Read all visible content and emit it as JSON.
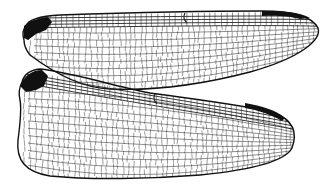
{
  "image": {
    "subject": "Dragonfly wings (forewing and hindwing) line illustration",
    "background": "#ffffff",
    "ink": "#111111",
    "wings": [
      {
        "name": "forewing",
        "outline": "M24,40 C22,33 24,28 26,26 C28,20 40,16 60,15 C120,13 200,11 262,11 C290,11 312,16 318,28 C322,40 300,58 250,72 C200,85 150,91 110,89 C80,88 50,70 30,55 C26,50 24,45 24,40 Z",
        "stigma": "M262,11 C285,11 300,12 310,18 L300,19 C290,16 275,15 262,16 Z",
        "base_dark": "M24,26 C30,20 40,18 48,17 L52,22 L46,30 L36,34 L28,40 L24,38 Z",
        "nodus_x": 185
      },
      {
        "name": "hindwing",
        "outline": "M22,82 C24,74 30,70 40,69 C70,72 110,85 150,93 C200,100 250,106 275,113 C292,120 298,132 292,148 C285,162 250,170 200,175 C150,179 90,180 50,176 C25,172 16,160 18,140 C20,125 22,110 20,100 C18,92 20,86 22,82 Z",
        "stigma": "M245,103 C262,106 276,110 285,118 L282,121 C272,115 258,110 245,108 Z",
        "base_dark": "M20,86 C24,76 32,70 42,70 L48,76 L44,86 L36,90 L26,92 Z",
        "nodus_x": 155
      }
    ]
  }
}
